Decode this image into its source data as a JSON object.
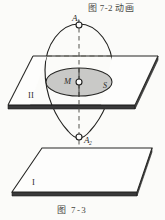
{
  "figure": {
    "top_caption": "图 7-2 动画",
    "bottom_caption": "图  7-3"
  },
  "labels": {
    "point_a1_base": "A",
    "point_a1_sub": "1",
    "point_a2_base": "A",
    "point_a2_sub": "2",
    "point_m": "M",
    "point_s": "S",
    "plane_upper": "II",
    "plane_lower": "I"
  },
  "colors": {
    "background": "#fbfbf9",
    "ink": "#2b2b29",
    "ellipse_fill": "#c9c9c7",
    "plane_fill": "#ffffff",
    "slab_edge": "#2a2a28",
    "dash_ink": "#55554f"
  },
  "geometry": {
    "ovoid": {
      "center_x": 79,
      "top_y": 24,
      "bottom_y": 139,
      "max_half_width": 34
    },
    "equator_ellipse": {
      "cx": 79,
      "cy": 82,
      "rx": 33,
      "ry": 14
    },
    "plane_upper": {
      "top_left": [
        33,
        56
      ],
      "top_right": [
        158,
        56
      ],
      "bottom_right": [
        135,
        105
      ],
      "bottom_left": [
        8,
        105
      ],
      "thickness": 4
    },
    "plane_lower": {
      "top_left": [
        42,
        148
      ],
      "top_right": [
        152,
        148
      ],
      "bottom_right": [
        137,
        192
      ],
      "bottom_left": [
        12,
        192
      ],
      "thickness": 4
    },
    "axis": {
      "x": 79,
      "from_y": 20,
      "to_y": 145
    },
    "markers": [
      {
        "name": "A1",
        "cx": 79,
        "cy": 25,
        "r": 3
      },
      {
        "name": "M",
        "cx": 79,
        "cy": 82,
        "r": 3
      },
      {
        "name": "A2",
        "cx": 79,
        "cy": 137,
        "r": 3
      }
    ]
  }
}
